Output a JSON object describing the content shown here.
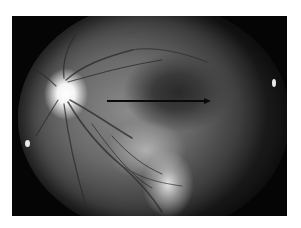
{
  "image": {
    "type": "grayscale fundus photograph",
    "description": "Retinal photograph showing bright optic disc on the left, branching vessels, a dark macular region and a pale area below; a black horizontal arrow points right across the macula.",
    "annotation": {
      "kind": "arrow",
      "direction": "right",
      "color": "#0a0a0a"
    },
    "colors": {
      "background": "#ffffff",
      "frame": "#050505",
      "disc": "#ffffff"
    }
  }
}
